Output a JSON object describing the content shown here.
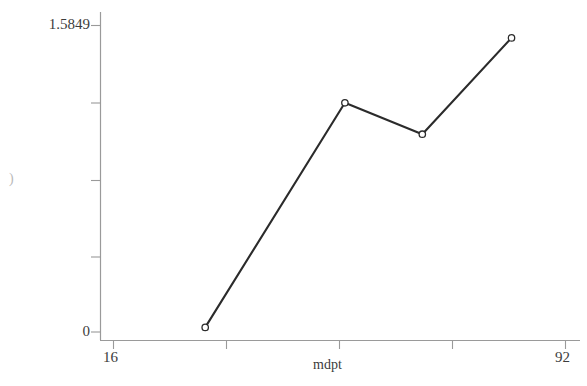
{
  "chart_data": {
    "type": "line",
    "title": "",
    "subtitle": "",
    "xlabel": "mdpt",
    "ylabel": "",
    "ylabel_partial_glyph": ")",
    "grid": false,
    "legend": null,
    "marker": "open-circle",
    "line_color": "#2b2b2b",
    "axis_color": "#9a9a9a",
    "background_color": "#ffffff",
    "xlim": [
      16,
      92
    ],
    "ylim": [
      0,
      1.5849
    ],
    "xticks": [
      16,
      35,
      54,
      73,
      92
    ],
    "xtick_labels": [
      "16",
      "",
      "",
      "",
      "92"
    ],
    "yticks": [
      0,
      0.3962,
      0.7925,
      1.1887,
      1.5849
    ],
    "ytick_labels": [
      "0",
      "",
      "",
      "",
      "1.5849"
    ],
    "x": [
      31.5,
      55.0,
      68.0,
      83.0
    ],
    "values": [
      0.024,
      1.185,
      1.023,
      1.521
    ],
    "points": [
      {
        "x": 31.5,
        "y": 0.024
      },
      {
        "x": 55.0,
        "y": 1.185
      },
      {
        "x": 68.0,
        "y": 1.023
      },
      {
        "x": 83.0,
        "y": 1.521
      }
    ]
  },
  "axes": {
    "y_top_label": "1.5849",
    "y_bottom_label": "0",
    "y_axis_title": ")",
    "x_left_label": "16",
    "x_right_label": "92",
    "x_axis_title": "mdpt"
  }
}
